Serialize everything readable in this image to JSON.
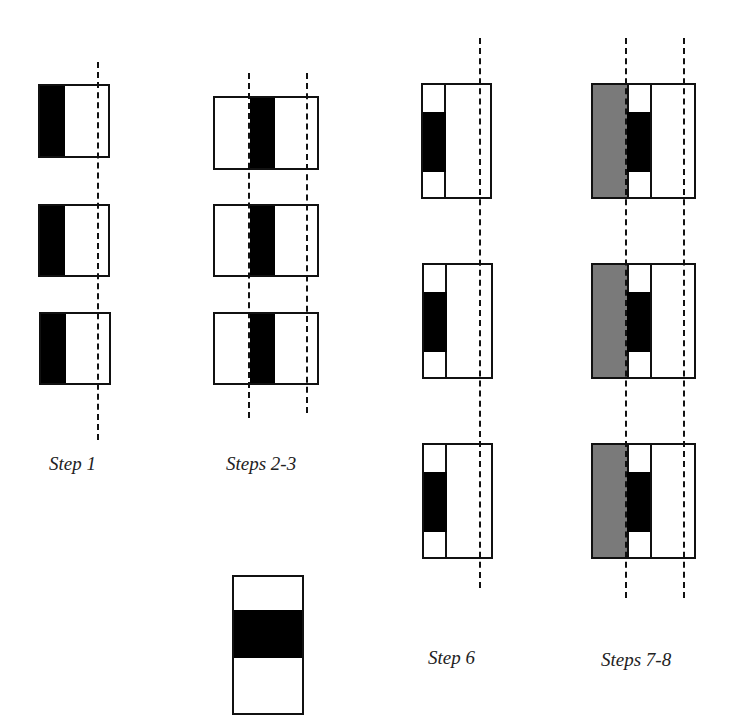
{
  "figure": {
    "panels": [
      {
        "id": "step1",
        "label": "Step 1"
      },
      {
        "id": "steps23",
        "label": "Steps 2-3"
      },
      {
        "id": "step6",
        "label": "Step 6"
      },
      {
        "id": "steps78",
        "label": "Steps 7-8"
      }
    ],
    "legend_piece": {
      "label": ""
    },
    "colors": {
      "black": "#000000",
      "gray": "#7a7a7a",
      "outline": "#111111"
    }
  }
}
